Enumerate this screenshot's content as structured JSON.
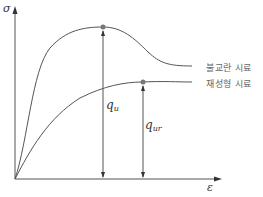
{
  "diagram": {
    "type": "stress-strain curve comparison",
    "axes": {
      "y_label": "σ",
      "x_label": "ε"
    },
    "curves": [
      {
        "name": "undisturbed",
        "label": "불교란 시료",
        "peak_label_base": "q",
        "peak_label_sub": "u"
      },
      {
        "name": "remolded",
        "label": "재성형 시료",
        "peak_label_base": "q",
        "peak_label_sub": "ur"
      }
    ],
    "colors": {
      "line": "#555555",
      "point": "#777777",
      "text": "#333333"
    }
  }
}
